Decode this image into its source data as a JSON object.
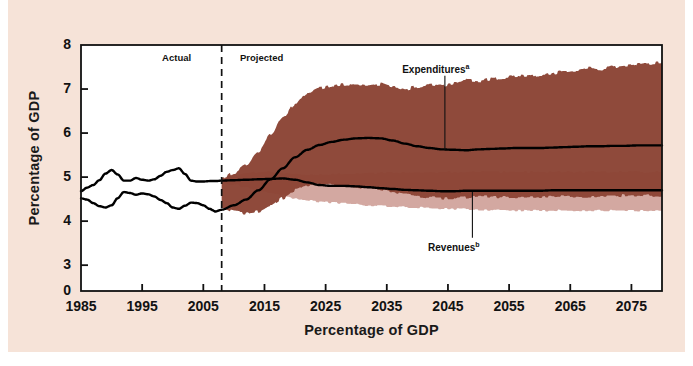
{
  "figure": {
    "background_color": "#f6e3d8",
    "plot_background_color": "#ffffff",
    "band_expenditures_color": "#8b4435",
    "band_revenues_color": "#c8928a",
    "line_color": "#000000"
  },
  "chart_data": {
    "type": "area",
    "title": "",
    "subtitle": "",
    "xlabel": "Percentage of GDP",
    "ylabel": "Percentage of GDP",
    "xlim": [
      1985,
      2080
    ],
    "ylim": [
      0,
      8
    ],
    "y_axis_break": true,
    "grid": false,
    "legend_position": "inline-annotation",
    "xticks": [
      1985,
      1995,
      2005,
      2015,
      2025,
      2035,
      2045,
      2055,
      2065,
      2075
    ],
    "yticks": [
      0,
      3,
      4,
      5,
      6,
      7,
      8
    ],
    "annotations": [
      {
        "name": "actual-label",
        "text": "Actual",
        "x": 2003,
        "y": 7.72
      },
      {
        "name": "projected-label",
        "text": "Projected",
        "x": 2011,
        "y": 7.72
      },
      {
        "name": "expenditures-label",
        "text": "Expenditures",
        "superscript": "a",
        "x": 2043,
        "y": 7.45
      },
      {
        "name": "revenues-label",
        "text": "Revenues",
        "superscript": "b",
        "x": 2046,
        "y": 3.42
      }
    ],
    "divider_year": 2008,
    "series": [
      {
        "name": "Expenditures",
        "superscript": "a",
        "kind": "line",
        "x": [
          1985,
          1986,
          1987,
          1988,
          1989,
          1990,
          1991,
          1992,
          1993,
          1994,
          1995,
          1996,
          1997,
          1998,
          1999,
          2000,
          2001,
          2002,
          2003,
          2004,
          2005,
          2006,
          2007,
          2008,
          2010,
          2012,
          2014,
          2016,
          2018,
          2020,
          2022,
          2024,
          2026,
          2028,
          2030,
          2032,
          2034,
          2036,
          2038,
          2040,
          2042,
          2044,
          2046,
          2048,
          2050,
          2052,
          2054,
          2056,
          2058,
          2060,
          2062,
          2064,
          2066,
          2068,
          2070,
          2072,
          2074,
          2076,
          2078,
          2080
        ],
        "values": [
          4.52,
          4.49,
          4.41,
          4.34,
          4.31,
          4.36,
          4.52,
          4.66,
          4.64,
          4.6,
          4.63,
          4.61,
          4.56,
          4.48,
          4.41,
          4.31,
          4.28,
          4.35,
          4.42,
          4.41,
          4.36,
          4.28,
          4.22,
          4.26,
          4.36,
          4.49,
          4.7,
          4.95,
          5.2,
          5.45,
          5.62,
          5.73,
          5.8,
          5.85,
          5.88,
          5.89,
          5.88,
          5.83,
          5.76,
          5.7,
          5.66,
          5.63,
          5.62,
          5.61,
          5.63,
          5.64,
          5.65,
          5.66,
          5.66,
          5.66,
          5.67,
          5.68,
          5.69,
          5.7,
          5.7,
          5.71,
          5.71,
          5.72,
          5.72,
          5.72
        ]
      },
      {
        "name": "Revenues",
        "superscript": "b",
        "kind": "line",
        "x": [
          1985,
          1986,
          1987,
          1988,
          1989,
          1990,
          1991,
          1992,
          1993,
          1994,
          1995,
          1996,
          1997,
          1998,
          1999,
          2000,
          2001,
          2002,
          2003,
          2004,
          2005,
          2006,
          2007,
          2008,
          2010,
          2012,
          2014,
          2016,
          2018,
          2020,
          2022,
          2024,
          2026,
          2028,
          2030,
          2032,
          2034,
          2036,
          2038,
          2040,
          2042,
          2044,
          2046,
          2048,
          2050,
          2052,
          2054,
          2056,
          2058,
          2060,
          2062,
          2064,
          2066,
          2068,
          2070,
          2072,
          2074,
          2076,
          2078,
          2080
        ],
        "values": [
          4.68,
          4.76,
          4.82,
          4.93,
          5.08,
          5.16,
          5.06,
          4.92,
          4.92,
          4.98,
          4.94,
          4.92,
          4.95,
          5.03,
          5.12,
          5.16,
          5.2,
          5.07,
          4.92,
          4.9,
          4.9,
          4.91,
          4.91,
          4.92,
          4.93,
          4.94,
          4.95,
          4.96,
          4.97,
          4.94,
          4.88,
          4.82,
          4.8,
          4.8,
          4.79,
          4.77,
          4.75,
          4.73,
          4.71,
          4.7,
          4.69,
          4.68,
          4.68,
          4.69,
          4.69,
          4.69,
          4.69,
          4.69,
          4.69,
          4.69,
          4.7,
          4.7,
          4.7,
          4.7,
          4.7,
          4.7,
          4.7,
          4.7,
          4.7,
          4.7
        ]
      },
      {
        "name": "Expenditures uncertainty band",
        "kind": "band",
        "color": "#8b4435",
        "x": [
          2008,
          2010,
          2012,
          2014,
          2016,
          2018,
          2020,
          2022,
          2024,
          2026,
          2028,
          2030,
          2032,
          2034,
          2036,
          2038,
          2040,
          2042,
          2044,
          2046,
          2048,
          2050,
          2052,
          2054,
          2056,
          2058,
          2060,
          2062,
          2064,
          2066,
          2068,
          2070,
          2072,
          2074,
          2076,
          2078,
          2080
        ],
        "upper": [
          4.95,
          5.1,
          5.28,
          5.58,
          5.95,
          6.35,
          6.65,
          6.9,
          7.02,
          7.08,
          7.1,
          7.08,
          7.07,
          7.11,
          7.05,
          7.0,
          7.05,
          7.1,
          7.08,
          7.13,
          7.2,
          7.18,
          7.22,
          7.26,
          7.3,
          7.28,
          7.32,
          7.36,
          7.4,
          7.42,
          7.48,
          7.45,
          7.5,
          7.54,
          7.56,
          7.58,
          7.6
        ],
        "lower": [
          4.3,
          4.22,
          4.18,
          4.22,
          4.35,
          4.52,
          4.7,
          4.82,
          4.85,
          4.83,
          4.8,
          4.78,
          4.76,
          4.72,
          4.66,
          4.6,
          4.56,
          4.54,
          4.52,
          4.52,
          4.54,
          4.56,
          4.55,
          4.54,
          4.54,
          4.54,
          4.54,
          4.55,
          4.56,
          4.56,
          4.56,
          4.58,
          4.58,
          4.58,
          4.58,
          4.58,
          4.58
        ]
      },
      {
        "name": "Revenues uncertainty band",
        "kind": "band",
        "color": "#c8928a",
        "x": [
          2008,
          2010,
          2012,
          2014,
          2016,
          2018,
          2020,
          2022,
          2024,
          2026,
          2028,
          2030,
          2032,
          2034,
          2036,
          2038,
          2040,
          2042,
          2044,
          2046,
          2048,
          2050,
          2052,
          2054,
          2056,
          2058,
          2060,
          2062,
          2064,
          2066,
          2068,
          2070,
          2072,
          2074,
          2076,
          2078,
          2080
        ],
        "upper": [
          4.96,
          5.04,
          5.1,
          5.12,
          5.12,
          5.1,
          5.08,
          5.06,
          5.06,
          5.07,
          5.08,
          5.08,
          5.09,
          5.1,
          5.1,
          5.1,
          5.11,
          5.12,
          5.12,
          5.12,
          5.12,
          5.12,
          5.12,
          5.12,
          5.12,
          5.12,
          5.12,
          5.12,
          5.12,
          5.12,
          5.12,
          5.12,
          5.12,
          5.12,
          5.12,
          5.12,
          5.12
        ],
        "lower": [
          4.88,
          4.82,
          4.76,
          4.7,
          4.64,
          4.58,
          4.52,
          4.47,
          4.44,
          4.42,
          4.4,
          4.38,
          4.36,
          4.34,
          4.33,
          4.32,
          4.31,
          4.3,
          4.29,
          4.28,
          4.27,
          4.26,
          4.25,
          4.25,
          4.24,
          4.24,
          4.24,
          4.24,
          4.24,
          4.24,
          4.24,
          4.24,
          4.24,
          4.24,
          4.24,
          4.24,
          4.24
        ]
      }
    ]
  }
}
